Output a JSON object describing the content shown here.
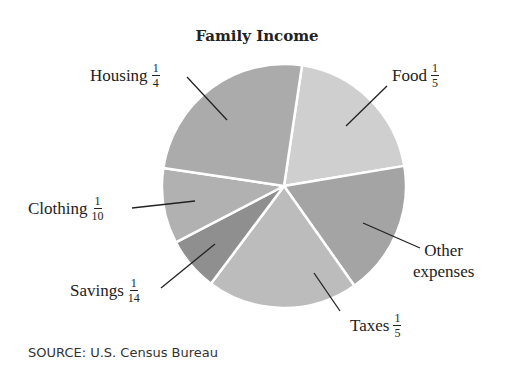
{
  "chart_data": {
    "type": "pie",
    "title": "Family Income",
    "source": "SOURCE: U.S. Census Bureau",
    "start_angle_deg": 8.5,
    "direction": "clockwise",
    "slices": [
      {
        "name": "Food",
        "fraction": "1/5",
        "value": 0.2,
        "color": "#cfcfcf"
      },
      {
        "name": "Other expenses",
        "fraction": "",
        "value": 0.1786,
        "color": "#a4a4a4"
      },
      {
        "name": "Taxes",
        "fraction": "1/5",
        "value": 0.2,
        "color": "#bcbcbc"
      },
      {
        "name": "Savings",
        "fraction": "1/14",
        "value": 0.0714,
        "color": "#8f8f8f"
      },
      {
        "name": "Clothing",
        "fraction": "1/10",
        "value": 0.1,
        "color": "#b1b1b1"
      },
      {
        "name": "Housing",
        "fraction": "1/4",
        "value": 0.25,
        "color": "#ababab"
      }
    ]
  },
  "labels": {
    "housing": {
      "text": "Housing",
      "num": "1",
      "den": "4"
    },
    "food": {
      "text": "Food",
      "num": "1",
      "den": "5"
    },
    "clothing": {
      "text": "Clothing",
      "num": "1",
      "den": "10"
    },
    "savings": {
      "text": "Savings",
      "num": "1",
      "den": "14"
    },
    "other_line1": "Other",
    "other_line2": "expenses",
    "taxes": {
      "text": "Taxes",
      "num": "1",
      "den": "5"
    }
  }
}
